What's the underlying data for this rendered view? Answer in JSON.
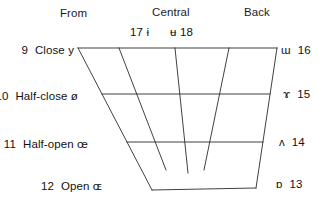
{
  "diagram": {
    "column_headers": [
      {
        "label": "From"
      },
      {
        "label": "Central"
      },
      {
        "label": "Back"
      }
    ],
    "central_symbols": [
      {
        "number": "17",
        "symbol": "ɨ",
        "text": "17  ɨ"
      },
      {
        "number": "18",
        "symbol": "ʉ",
        "text": "ʉ  18"
      }
    ],
    "left_labels": [
      {
        "number": "9",
        "height": "Close",
        "symbol": "y",
        "text": "Close y"
      },
      {
        "number": "10",
        "height": "Half-close",
        "symbol": "ø",
        "text": "Half-close ø"
      },
      {
        "number": "11",
        "height": "Half-open",
        "symbol": "œ",
        "text": "Half-open œ"
      },
      {
        "number": "12",
        "height": "Open",
        "symbol": "ɶ",
        "text": "Open ɶ"
      }
    ],
    "right_labels": [
      {
        "number": "16",
        "symbol": "ɯ"
      },
      {
        "number": "15",
        "symbol": "ɤ"
      },
      {
        "number": "14",
        "symbol": "ʌ"
      },
      {
        "number": "13",
        "symbol": "ɒ"
      }
    ],
    "colors": {
      "line": "#2b2b2b",
      "text": "#111111",
      "background": "#ffffff"
    },
    "geometry": {
      "outline_note": "trapezoid, wide at top, narrow at bottom",
      "horizontal_rows": 2,
      "interior_slant_lines": 3
    }
  }
}
